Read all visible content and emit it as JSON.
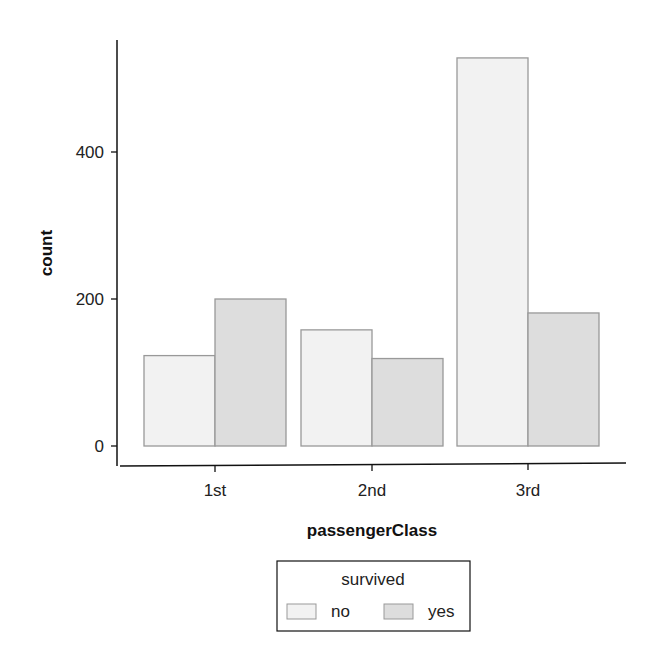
{
  "chart_data": {
    "type": "bar",
    "title": "",
    "xlabel": "passengerClass",
    "ylabel": "count",
    "categories": [
      "1st",
      "2nd",
      "3rd"
    ],
    "series": [
      {
        "name": "no",
        "values": [
          123,
          158,
          528
        ],
        "color": "#f2f2f2"
      },
      {
        "name": "yes",
        "values": [
          200,
          119,
          181
        ],
        "color": "#dddddd"
      }
    ],
    "yticks": [
      0,
      200,
      400
    ],
    "ylim": [
      0,
      540
    ],
    "grid": false,
    "legend": {
      "title": "survived",
      "position": "bottom",
      "entries": [
        "no",
        "yes"
      ]
    }
  },
  "axes": {
    "xlabel": "passengerClass",
    "ylabel": "count",
    "yticks": [
      "0",
      "200",
      "400"
    ],
    "xticks": [
      "1st",
      "2nd",
      "3rd"
    ]
  },
  "legend": {
    "title": "survived",
    "items": [
      {
        "label": "no",
        "color": "#f2f2f2"
      },
      {
        "label": "yes",
        "color": "#dddddd"
      }
    ]
  },
  "colors": {
    "bar_stroke": "#999999",
    "axis": "#111111"
  }
}
